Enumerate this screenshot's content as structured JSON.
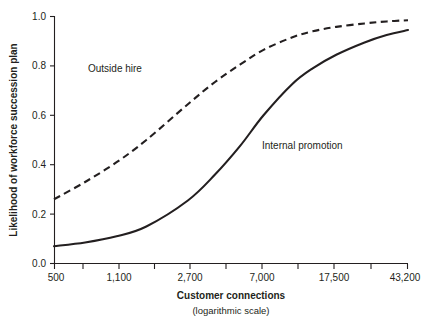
{
  "chart_data": {
    "type": "line",
    "title": "",
    "xlabel": "Customer connections",
    "xlabel_sub": "(logarithmic scale)",
    "ylabel": "Likelihood of workforce succession plan",
    "xscale": "log",
    "xlim": [
      500,
      43200
    ],
    "ylim": [
      0.0,
      1.0
    ],
    "grid": false,
    "legend_position": "inline-annotations",
    "x_tick_labels": [
      "500",
      "1,100",
      "2,700",
      "7,000",
      "17,500",
      "43,200"
    ],
    "x_tick_values": [
      500,
      1100,
      2700,
      7000,
      17500,
      43200
    ],
    "x_minor_ticks": true,
    "y_tick_labels": [
      "0.0",
      "0.2",
      "0.4",
      "0.6",
      "0.8",
      "1.0"
    ],
    "y_tick_values": [
      0.0,
      0.2,
      0.4,
      0.6,
      0.8,
      1.0
    ],
    "x": [
      500,
      740,
      1100,
      1600,
      2700,
      3800,
      5200,
      7000,
      10000,
      13000,
      17500,
      25000,
      33000,
      43200
    ],
    "series": [
      {
        "name": "Outside hire",
        "style": "dashed",
        "color": "#231f20",
        "values": [
          0.26,
          0.33,
          0.41,
          0.5,
          0.645,
          0.735,
          0.805,
          0.865,
          0.915,
          0.94,
          0.958,
          0.972,
          0.98,
          0.985
        ]
      },
      {
        "name": "Internal promotion",
        "style": "solid",
        "color": "#231f20",
        "values": [
          0.07,
          0.085,
          0.11,
          0.15,
          0.255,
          0.36,
          0.475,
          0.6,
          0.725,
          0.79,
          0.845,
          0.895,
          0.925,
          0.945
        ]
      }
    ],
    "annotations": [
      {
        "text": "Outside hire",
        "x_px": 88,
        "y_px": 72
      },
      {
        "text": "Internal promotion",
        "x_px": 262,
        "y_px": 149
      }
    ]
  }
}
